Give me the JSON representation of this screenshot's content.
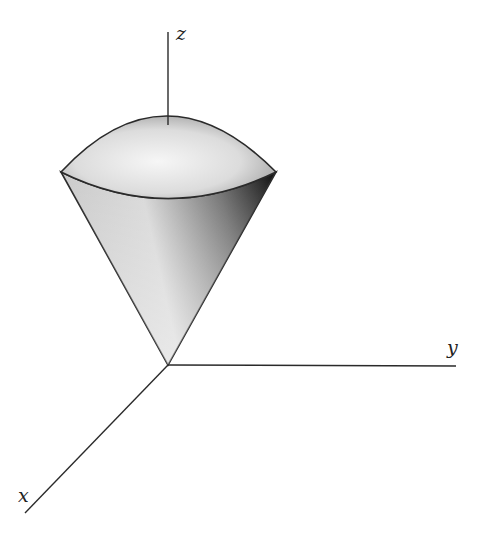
{
  "diagram": {
    "axes": {
      "x_label": "x",
      "y_label": "y",
      "z_label": "z"
    },
    "colors": {
      "stroke": "#2a2a2a",
      "cap_light": "#f4f4f4",
      "cap_dark": "#9a9a9a",
      "cone_light": "#e6e6e6",
      "cone_dark": "#1e1e1e"
    }
  }
}
